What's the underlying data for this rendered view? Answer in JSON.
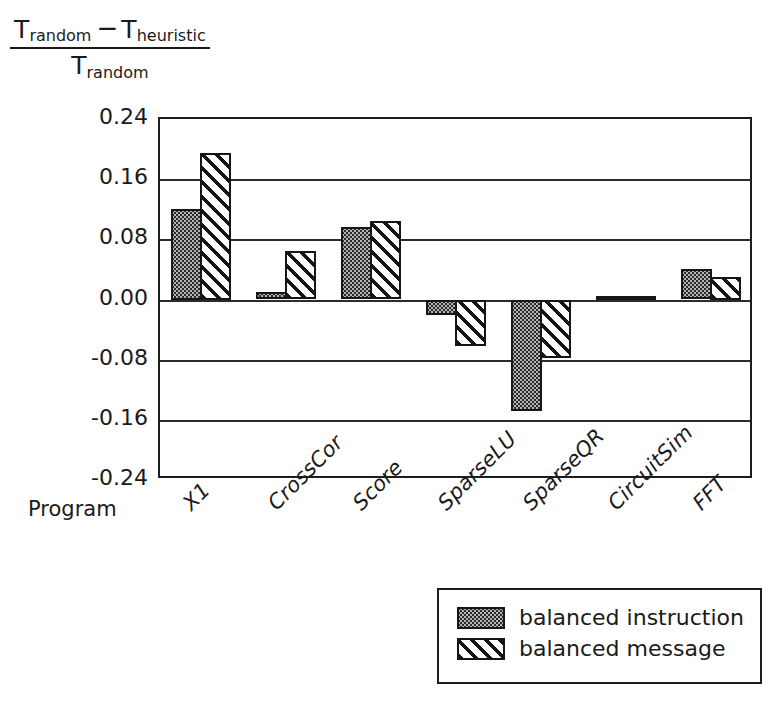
{
  "chart_data": {
    "type": "bar",
    "title": "",
    "ylabel_numerator_left": "T",
    "ylabel_numerator_left_sub": "random",
    "ylabel_minus": "−",
    "ylabel_numerator_right": "T",
    "ylabel_numerator_right_sub": "heuristic",
    "ylabel_denominator": "T",
    "ylabel_denominator_sub": "random",
    "xlabel": "Program",
    "categories": [
      "X1",
      "CrossCor",
      "Score",
      "SparseLU",
      "SparseQR",
      "CircuitSim",
      "FFT"
    ],
    "series": [
      {
        "name": "balanced instruction",
        "values": [
          0.12,
          0.01,
          0.096,
          -0.02,
          -0.148,
          0.005,
          0.04
        ]
      },
      {
        "name": "balanced message",
        "values": [
          0.195,
          0.065,
          0.104,
          -0.062,
          -0.078,
          0.005,
          0.03
        ]
      }
    ],
    "yticks": [
      "0.24",
      "0.16",
      "0.08",
      "0.00",
      "-0.08",
      "-0.16",
      "-0.24"
    ],
    "ytick_values": [
      0.24,
      0.16,
      0.08,
      0.0,
      -0.08,
      -0.16,
      -0.24
    ],
    "ylim": [
      -0.24,
      0.24
    ],
    "grid": true,
    "legend_position": "bottom-right"
  },
  "legend": {
    "entries": [
      {
        "label": "balanced instruction",
        "pattern": "stipple-fill"
      },
      {
        "label": "balanced message",
        "pattern": "diagonal-hatch"
      }
    ]
  },
  "colors": {
    "axis": "#1d1d1d",
    "grid": "#2b2b2b",
    "instruction_fill": "#b4b4b4",
    "message_fill": "#ffffff",
    "text": "#1a1a1a"
  }
}
